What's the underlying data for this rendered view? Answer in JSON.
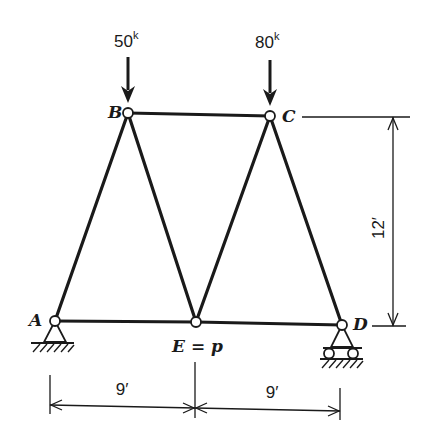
{
  "diagram": {
    "type": "truss",
    "nodes": {
      "A": {
        "label": "A",
        "support": "pin"
      },
      "B": {
        "label": "B"
      },
      "C": {
        "label": "C"
      },
      "D": {
        "label": "D",
        "support": "roller"
      },
      "E": {
        "label": "E = p"
      }
    },
    "members": [
      "AB",
      "BC",
      "CD",
      "AE",
      "ED",
      "BE",
      "EC"
    ],
    "loads": [
      {
        "node": "B",
        "value": "50",
        "unit": "k"
      },
      {
        "node": "C",
        "value": "80",
        "unit": "k"
      }
    ],
    "dimensions": {
      "span_left": "9′",
      "span_right": "9′",
      "height": "12′"
    }
  }
}
